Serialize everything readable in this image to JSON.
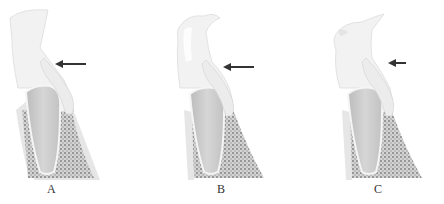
{
  "figure": {
    "panels": [
      {
        "id": "A",
        "label": "A",
        "arrow": "arrow-pointing-left"
      },
      {
        "id": "B",
        "label": "B",
        "arrow": "arrow-pointing-left"
      },
      {
        "id": "C",
        "label": "C",
        "arrow": "arrow-pointing-left"
      }
    ],
    "colors": {
      "gingiva": "#efefef",
      "tooth_root": "#cfcfcf",
      "bone": "#bdbdbd",
      "arrow": "#333333"
    }
  }
}
